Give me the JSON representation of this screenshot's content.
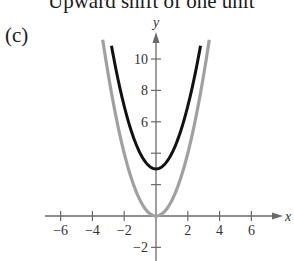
{
  "header": {
    "title": "Upward shift of one unit",
    "panel_label": "(c)"
  },
  "chart_data": {
    "type": "line",
    "title": "Upward shift of one unit",
    "panel": "(c)",
    "xlabel": "x",
    "ylabel": "y",
    "xlim": [
      -7,
      8
    ],
    "ylim": [
      -2.5,
      11.5
    ],
    "grid": false,
    "x_ticks": [
      -6,
      -4,
      -2,
      2,
      4,
      6
    ],
    "x_tick_labels": [
      "−6",
      "−4",
      "−2",
      "2",
      "4",
      "6"
    ],
    "y_ticks": [
      -2,
      2,
      4,
      6,
      8,
      10
    ],
    "y_tick_labels": [
      "−2",
      "",
      "",
      "6",
      "8",
      "10"
    ],
    "series": [
      {
        "name": "original (gray)",
        "color": "#a0a0a0",
        "formula": "y = x^2",
        "x": [
          -3.35,
          -3,
          -2.5,
          -2,
          -1.5,
          -1,
          -0.5,
          0,
          0.5,
          1,
          1.5,
          2,
          2.5,
          3,
          3.35
        ],
        "y": [
          11.22,
          9,
          6.25,
          4,
          2.25,
          1,
          0.25,
          0,
          0.25,
          1,
          2.25,
          4,
          6.25,
          9,
          11.22
        ]
      },
      {
        "name": "shifted (black)",
        "color": "#111111",
        "formula": "y = x^2 + 3",
        "x": [
          -2.8,
          -2.5,
          -2,
          -1.5,
          -1,
          -0.5,
          0,
          0.5,
          1,
          1.5,
          2,
          2.5,
          2.8
        ],
        "y": [
          10.84,
          9.25,
          7,
          5.25,
          4,
          3.25,
          3,
          3.25,
          4,
          5.25,
          7,
          9.25,
          10.84
        ]
      }
    ],
    "vertex_shifted": [
      0,
      3
    ],
    "vertex_original": [
      0,
      0
    ]
  },
  "colors": {
    "axis": "#6a6a6a",
    "original_curve": "#a0a0a0",
    "shifted_curve": "#111111"
  }
}
